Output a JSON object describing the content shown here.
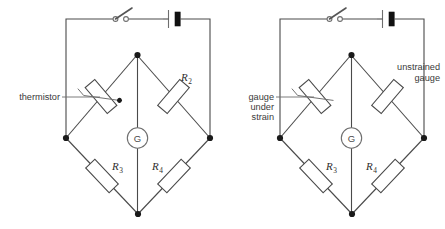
{
  "figure": {
    "background_color": "#ffffff",
    "wire_color": "#4a4a4a",
    "node_color": "#1a1a1a",
    "battery_fill": "#111111"
  },
  "circuits": [
    {
      "id": "thermistor-bridge",
      "name": "thermistor bridge circuit",
      "annotations": [
        {
          "name": "thermistor-label",
          "text": "thermistor",
          "lines": [
            "thermistor"
          ]
        }
      ],
      "components": [
        {
          "name": "switch",
          "type": "switch",
          "state": "open",
          "label": ""
        },
        {
          "name": "battery",
          "type": "battery",
          "label": ""
        },
        {
          "name": "thermistor",
          "type": "thermistor",
          "label": ""
        },
        {
          "name": "resistor-r2",
          "type": "resistor",
          "label": "R",
          "subscript": "2"
        },
        {
          "name": "resistor-r3",
          "type": "resistor",
          "label": "R",
          "subscript": "3"
        },
        {
          "name": "resistor-r4",
          "type": "resistor",
          "label": "R",
          "subscript": "4"
        },
        {
          "name": "galvanometer",
          "type": "galvanometer",
          "label": "G"
        }
      ]
    },
    {
      "id": "strain-gauge-bridge",
      "name": "strain gauge bridge circuit",
      "annotations": [
        {
          "name": "gauge-under-strain-label",
          "text": "gauge under strain",
          "lines": [
            "gauge",
            "under",
            "strain"
          ]
        },
        {
          "name": "unstrained-gauge-label",
          "text": "unstrained gauge",
          "lines": [
            "unstrained",
            "gauge"
          ]
        }
      ],
      "components": [
        {
          "name": "switch",
          "type": "switch",
          "state": "open",
          "label": ""
        },
        {
          "name": "battery",
          "type": "battery",
          "label": ""
        },
        {
          "name": "gauge-under-strain",
          "type": "strain-gauge",
          "label": ""
        },
        {
          "name": "unstrained-gauge",
          "type": "resistor",
          "label": ""
        },
        {
          "name": "resistor-r3",
          "type": "resistor",
          "label": "R",
          "subscript": "3"
        },
        {
          "name": "resistor-r4",
          "type": "resistor",
          "label": "R",
          "subscript": "4"
        },
        {
          "name": "galvanometer",
          "type": "galvanometer",
          "label": "G"
        }
      ]
    }
  ],
  "labels": {
    "thermistor": "thermistor",
    "gauge_l1": "gauge",
    "gauge_l2": "under",
    "gauge_l3": "strain",
    "unstrained_l1": "unstrained",
    "unstrained_l2": "gauge",
    "R": "R",
    "sub2": "2",
    "sub3": "3",
    "sub4": "4",
    "G": "G"
  }
}
